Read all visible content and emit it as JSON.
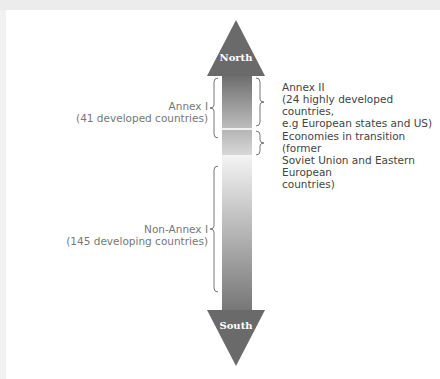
{
  "diagram": {
    "arrow": {
      "top_label": "North",
      "bottom_label": "South",
      "colors": {
        "head": "#6a6a6a",
        "shaft_dark": "#7a7a7a",
        "shaft_light": "#e8e8e8"
      }
    },
    "right_labels": [
      {
        "title": "Annex II",
        "lines": [
          "(24 highly developed  countries,",
          "e.g European states and US)"
        ]
      },
      {
        "title": "Economies in transition (former",
        "lines": [
          "Soviet Union and Eastern European",
          "countries)"
        ]
      }
    ],
    "left_labels": [
      {
        "title": "Annex I",
        "lines": [
          "(41 developed countries)"
        ]
      },
      {
        "title": "Non-Annex I",
        "lines": [
          "(145 developing countries)"
        ]
      }
    ]
  }
}
